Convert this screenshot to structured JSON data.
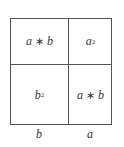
{
  "diagram": {
    "title": "",
    "cells": {
      "top_left": {
        "left": "a",
        "operator": "∗",
        "right": "b"
      },
      "top_right": {
        "base": "a",
        "exponent": "2"
      },
      "bottom_left": {
        "base": "b",
        "exponent": "2"
      },
      "bottom_right": {
        "left": "a",
        "operator": "∗",
        "right": "b"
      }
    },
    "bottom_labels": {
      "left_column": "b",
      "right_column": "a"
    }
  }
}
